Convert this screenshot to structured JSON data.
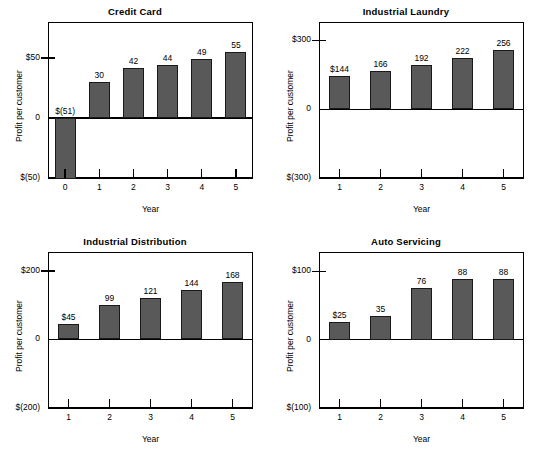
{
  "figure": {
    "background": "#ffffff",
    "bar_fill": "#595959",
    "bar_stroke": "#1a1a1a",
    "axis_color": "#000000"
  },
  "chart_data": [
    {
      "type": "bar",
      "title": "Credit Card",
      "xlabel": "Year",
      "ylabel": "Profit per customer",
      "categories": [
        "0",
        "1",
        "2",
        "3",
        "4",
        "5"
      ],
      "values": [
        -51,
        30,
        42,
        44,
        49,
        55
      ],
      "data_labels": [
        "$(51)",
        "30",
        "42",
        "44",
        "49",
        "55"
      ],
      "ylim": [
        -50,
        80
      ],
      "ytick_values": [
        50,
        0,
        -50
      ],
      "ytick_labels": [
        "$50",
        "0",
        "$(50)"
      ],
      "grid": false,
      "legend": "none"
    },
    {
      "type": "bar",
      "title": "Industrial Laundry",
      "xlabel": "Year",
      "ylabel": "Profit per customer",
      "categories": [
        "1",
        "2",
        "3",
        "4",
        "5"
      ],
      "values": [
        144,
        166,
        192,
        222,
        256
      ],
      "data_labels": [
        "$144",
        "166",
        "192",
        "222",
        "256"
      ],
      "ylim": [
        -300,
        380
      ],
      "ytick_values": [
        300,
        0,
        -300
      ],
      "ytick_labels": [
        "$300",
        "0",
        "$(300)"
      ],
      "grid": false,
      "legend": "none"
    },
    {
      "type": "bar",
      "title": "Industrial Distribution",
      "xlabel": "Year",
      "ylabel": "Profit per customer",
      "categories": [
        "1",
        "2",
        "3",
        "4",
        "5"
      ],
      "values": [
        45,
        99,
        121,
        144,
        168
      ],
      "data_labels": [
        "$45",
        "99",
        "121",
        "144",
        "168"
      ],
      "ylim": [
        -200,
        255
      ],
      "ytick_values": [
        200,
        0,
        -200
      ],
      "ytick_labels": [
        "$200",
        "0",
        "$(200)"
      ],
      "grid": false,
      "legend": "none"
    },
    {
      "type": "bar",
      "title": "Auto Servicing",
      "xlabel": "Year",
      "ylabel": "Profit per customer",
      "categories": [
        "1",
        "2",
        "3",
        "4",
        "5"
      ],
      "values": [
        25,
        35,
        76,
        88,
        88
      ],
      "data_labels": [
        "$25",
        "35",
        "76",
        "88",
        "88"
      ],
      "ylim": [
        -100,
        128
      ],
      "ytick_values": [
        100,
        0,
        -100
      ],
      "ytick_labels": [
        "$100",
        "0",
        "$(100)"
      ],
      "grid": false,
      "legend": "none"
    }
  ]
}
